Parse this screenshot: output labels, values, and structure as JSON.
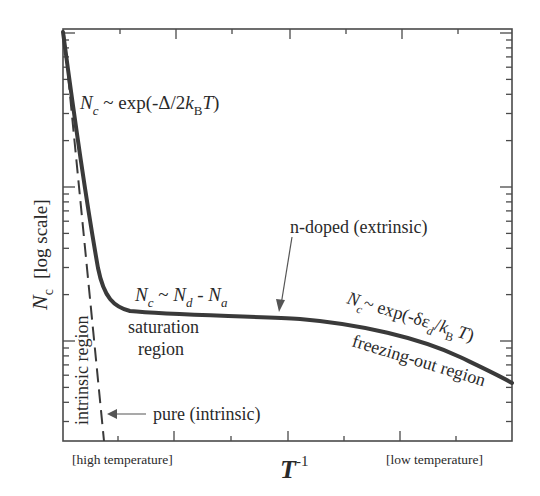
{
  "chart_data": {
    "type": "line",
    "title": "",
    "xlabel": "T^-1",
    "ylabel": "N_c [log scale]",
    "x_scale": "linear",
    "y_scale": "log",
    "x_tick_labels_left": "[high temperature]",
    "x_tick_labels_right": "[low temperature]",
    "grid": false,
    "legend": null,
    "series": [
      {
        "name": "n-doped (extrinsic)",
        "style": "solid",
        "color": "#3a3a3a",
        "points_px": [
          [
            63,
            32
          ],
          [
            70,
            80
          ],
          [
            78,
            140
          ],
          [
            86,
            195
          ],
          [
            94,
            245
          ],
          [
            100,
            275
          ],
          [
            106,
            293
          ],
          [
            113,
            303
          ],
          [
            122,
            309
          ],
          [
            135,
            312
          ],
          [
            160,
            314
          ],
          [
            200,
            315
          ],
          [
            250,
            317
          ],
          [
            290,
            319
          ],
          [
            330,
            323
          ],
          [
            370,
            329
          ],
          [
            410,
            340
          ],
          [
            450,
            354
          ],
          [
            480,
            366
          ],
          [
            512,
            383
          ]
        ]
      },
      {
        "name": "pure (intrinsic)",
        "style": "dashed",
        "color": "#3a3a3a",
        "points_px": [
          [
            63,
            32
          ],
          [
            104,
            441
          ]
        ]
      }
    ],
    "annotations": [
      {
        "text": "N_c ~ exp(-Δ/2k_B T)",
        "region": "intrinsic slope"
      },
      {
        "text": "N_c ~ N_d - N_a",
        "region": "saturation"
      },
      {
        "text": "saturation region"
      },
      {
        "text": "n-doped (extrinsic)",
        "arrow": true
      },
      {
        "text": "N_c ~ exp(-δε_d/k_B T)",
        "region": "freeze-out slope"
      },
      {
        "text": "freezing-out region"
      },
      {
        "text": "intrinsic region",
        "rotated": true
      },
      {
        "text": "pure (intrinsic)",
        "arrow": true
      }
    ]
  },
  "labels": {
    "ylabel_main": "N",
    "ylabel_sub": "c",
    "ylabel_rest": "[log scale]",
    "xlabel_main": "T",
    "xlabel_sup": "-1",
    "x_left_note": "[high temperature]",
    "x_right_note": "[low temperature]",
    "eq1_N": "N",
    "eq1_c": "c",
    "eq1_mid": " ~ exp(-Δ/2",
    "eq1_k": "k",
    "eq1_B": "B",
    "eq1_T": "T",
    "eq1_end": ")",
    "eq2_N1": "N",
    "eq2_c": "c",
    "eq2_tilde": " ~ ",
    "eq2_N2": "N",
    "eq2_d": "d",
    "eq2_minus": " - ",
    "eq2_N3": "N",
    "eq2_a": "a",
    "sat1": "saturation",
    "sat2": "region",
    "ndoped": "n-doped (extrinsic)",
    "eq3_N": "N",
    "eq3_c": "c",
    "eq3_mid": "~ exp(-δε",
    "eq3_d": "d",
    "eq3_slash": "/",
    "eq3_k": "k",
    "eq3_B": "B",
    "eq3_T": "T",
    "eq3_end": ")",
    "freeze": "freezing-out region",
    "intrinsic_region": "intrinsic region",
    "pure": "pure (intrinsic)"
  },
  "colors": {
    "curve": "#3a3a3a",
    "axes": "#4a4a4a",
    "text": "#2a2a2a",
    "arrow": "#555555"
  }
}
